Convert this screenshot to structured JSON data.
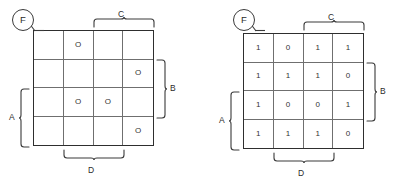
{
  "figure": {
    "type": "karnaugh-map-pair",
    "ink_color": "#2e2e2e",
    "grid_line_color": "#6f6f6f",
    "background": "#ffffff"
  },
  "maps": [
    {
      "id": "left",
      "output_label": "F",
      "rows": 4,
      "columns": 4,
      "cells": [
        [
          "",
          "O",
          "",
          ""
        ],
        [
          "",
          "",
          "",
          "O"
        ],
        [
          "",
          "O",
          "O",
          ""
        ],
        [
          "",
          "",
          "",
          "O"
        ]
      ],
      "brackets": {
        "top": {
          "label": "C",
          "spans_columns": [
            3,
            4
          ]
        },
        "bottom": {
          "label": "D",
          "spans_columns": [
            2,
            3
          ]
        },
        "left": {
          "label": "A",
          "spans_rows": [
            3,
            4
          ]
        },
        "right": {
          "label": "B",
          "spans_rows": [
            2,
            3
          ]
        }
      }
    },
    {
      "id": "right",
      "output_label": "F",
      "rows": 4,
      "columns": 4,
      "cells": [
        [
          "1",
          "0",
          "1",
          "1"
        ],
        [
          "1",
          "1",
          "1",
          "0"
        ],
        [
          "1",
          "0",
          "0",
          "1"
        ],
        [
          "1",
          "1",
          "1",
          "0"
        ]
      ],
      "brackets": {
        "top": {
          "label": "C",
          "spans_columns": [
            3,
            4
          ]
        },
        "bottom": {
          "label": "D",
          "spans_columns": [
            2,
            3
          ]
        },
        "left": {
          "label": "A",
          "spans_rows": [
            3,
            4
          ]
        },
        "right": {
          "label": "B",
          "spans_rows": [
            2,
            3
          ]
        }
      }
    }
  ]
}
